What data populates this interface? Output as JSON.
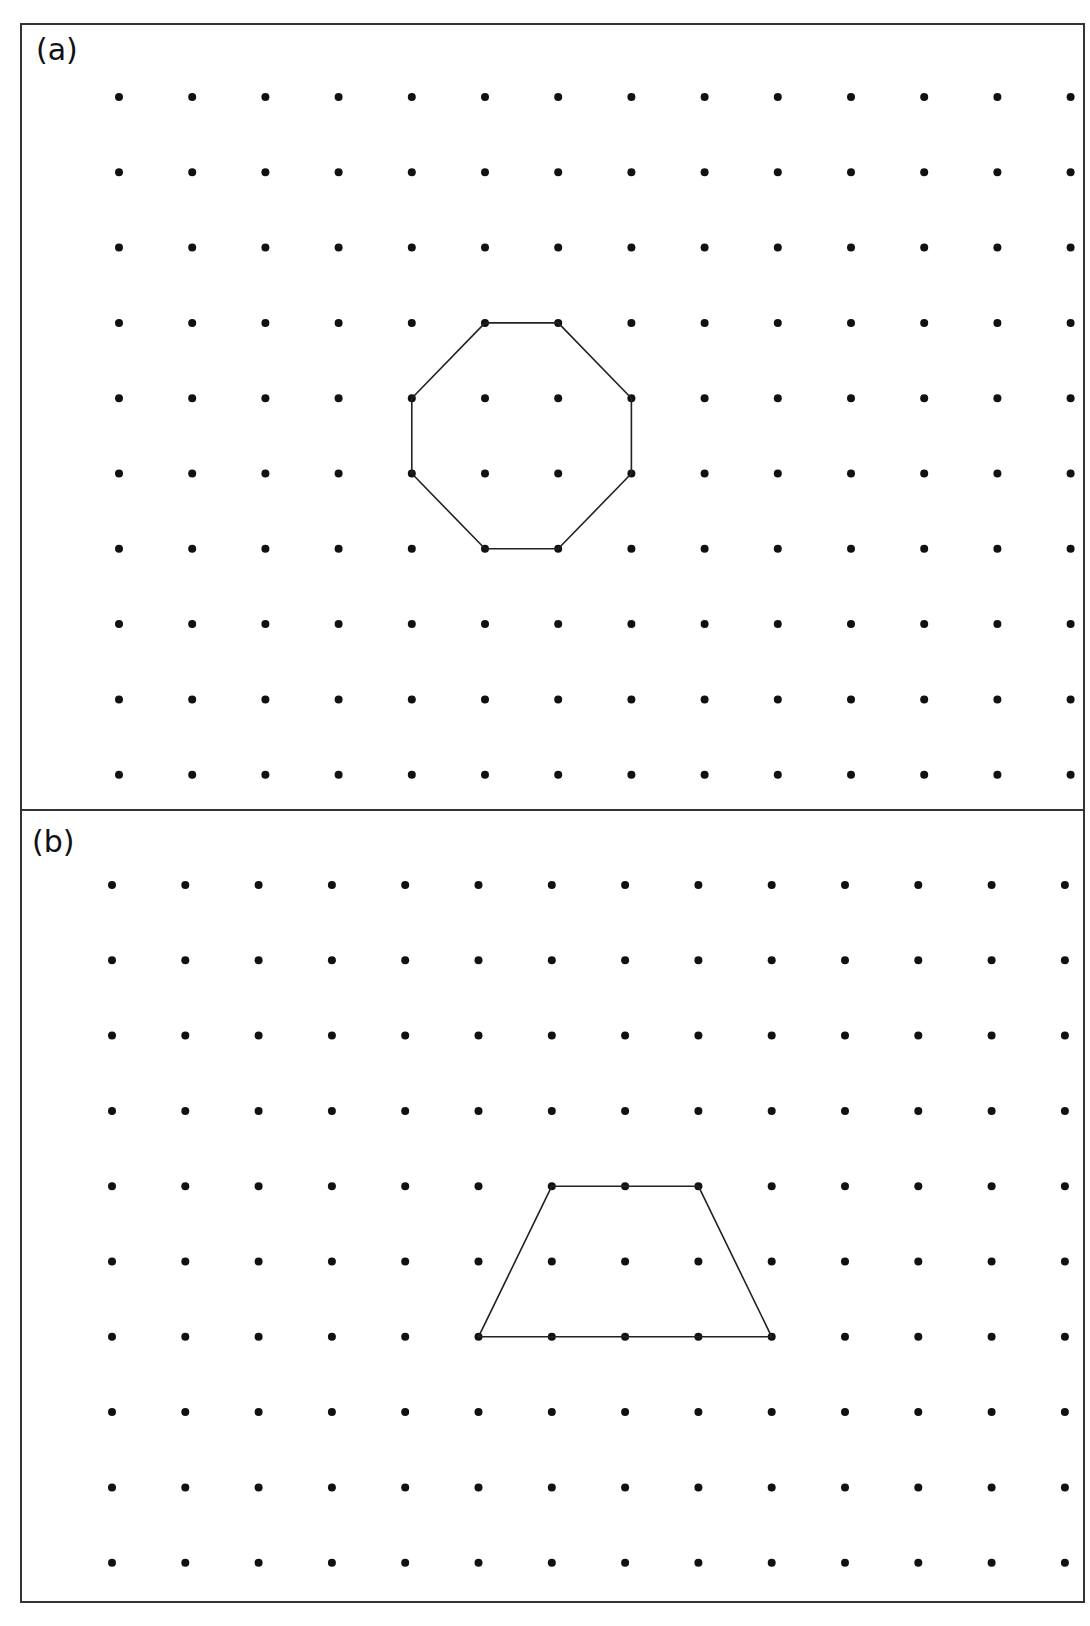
{
  "figure": {
    "frame": {
      "x1": 21,
      "y1": 24,
      "x2": 1084,
      "y2": 1602,
      "stroke": "#333333"
    },
    "divider_y": 810,
    "dot_color": "#111111",
    "line_color": "#222222"
  },
  "panels": [
    {
      "id": "a",
      "label": "(a)",
      "label_pos": [
        36,
        60
      ],
      "grid": {
        "rows": 10,
        "cols": 14,
        "x0": 119,
        "y0": 97,
        "dx": 73.2,
        "dy": 75.3
      },
      "shape": {
        "name": "octagon",
        "vertices_rc": [
          [
            3,
            5
          ],
          [
            3,
            6
          ],
          [
            4,
            7
          ],
          [
            5,
            7
          ],
          [
            6,
            6
          ],
          [
            6,
            5
          ],
          [
            5,
            4
          ],
          [
            4,
            4
          ]
        ]
      }
    },
    {
      "id": "b",
      "label": "(b)",
      "label_pos": [
        32,
        852
      ],
      "grid": {
        "rows": 10,
        "cols": 14,
        "x0": 112,
        "y0": 885,
        "dx": 73.3,
        "dy": 75.3
      },
      "shape": {
        "name": "trapezoid",
        "vertices_rc": [
          [
            4,
            6
          ],
          [
            4,
            8
          ],
          [
            6,
            9
          ],
          [
            6,
            5
          ]
        ]
      }
    }
  ]
}
